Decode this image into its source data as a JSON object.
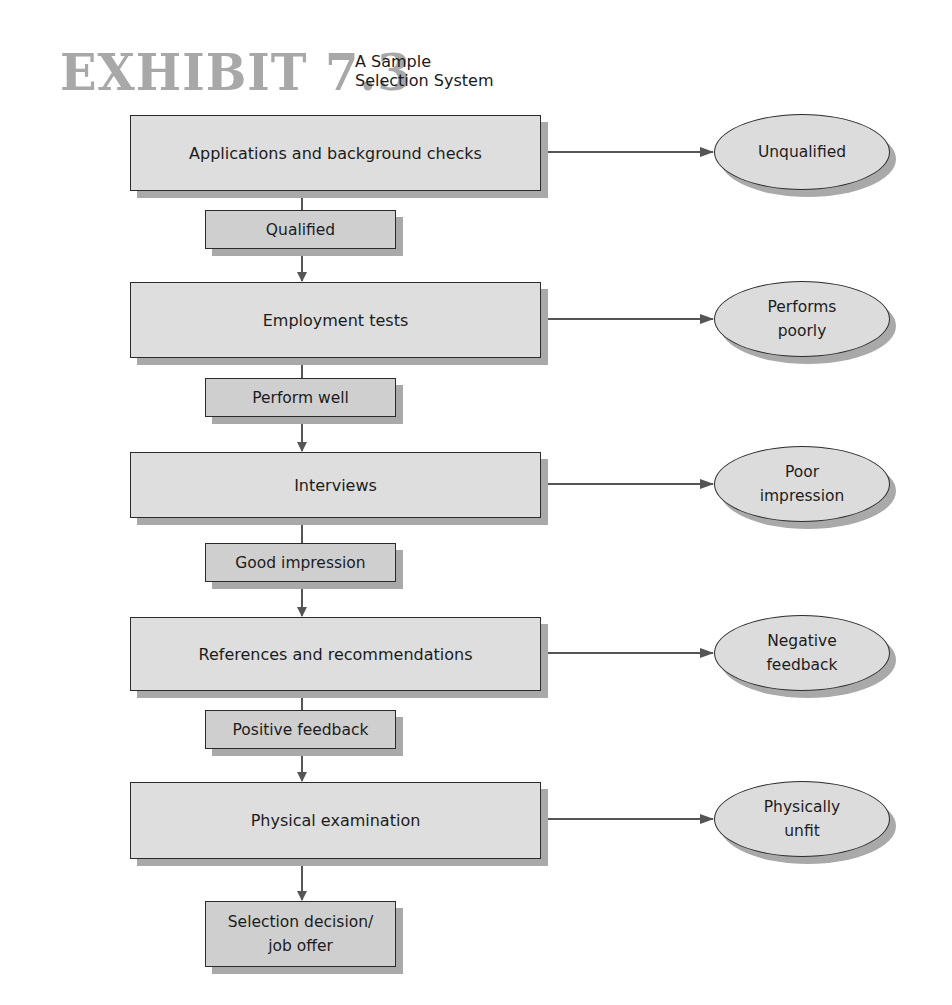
{
  "title": {
    "exhibit": "EXHIBIT 7.3",
    "subtitle_line1": "A Sample",
    "subtitle_line2": "Selection System"
  },
  "steps": [
    {
      "label": "Applications and background checks",
      "pass": "Qualified",
      "fail": "Unqualified"
    },
    {
      "label": "Employment tests",
      "pass": "Perform well",
      "fail_line1": "Performs",
      "fail_line2": "poorly"
    },
    {
      "label": "Interviews",
      "pass": "Good impression",
      "fail_line1": "Poor",
      "fail_line2": "impression"
    },
    {
      "label": "References and recommendations",
      "pass": "Positive feedback",
      "fail_line1": "Negative",
      "fail_line2": "feedback"
    },
    {
      "label": "Physical examination",
      "fail_line1": "Physically",
      "fail_line2": "unfit"
    }
  ],
  "final": {
    "line1": "Selection decision/",
    "line2": "job offer"
  },
  "colors": {
    "box_fill": "#dedede",
    "label_fill": "#cfcfcf",
    "shadow": "#a9a9a9",
    "stroke": "#2b2b2b",
    "arrow": "#555555",
    "title_gray": "#a8a8a8"
  }
}
